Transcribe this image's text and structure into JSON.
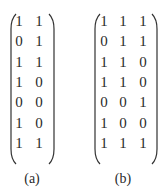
{
  "matrices": [
    {
      "label": "(a)",
      "rows": [
        [
          "1",
          "1"
        ],
        [
          "0",
          "1"
        ],
        [
          "1",
          "1"
        ],
        [
          "1",
          "0"
        ],
        [
          "0",
          "0"
        ],
        [
          "1",
          "0"
        ],
        [
          "1",
          "1"
        ]
      ]
    },
    {
      "label": "(b)",
      "rows": [
        [
          "1",
          "1",
          "1"
        ],
        [
          "0",
          "1",
          "1"
        ],
        [
          "1",
          "1",
          "0"
        ],
        [
          "1",
          "1",
          "0"
        ],
        [
          "0",
          "0",
          "1"
        ],
        [
          "1",
          "0",
          "0"
        ],
        [
          "1",
          "1",
          "1"
        ]
      ]
    }
  ]
}
